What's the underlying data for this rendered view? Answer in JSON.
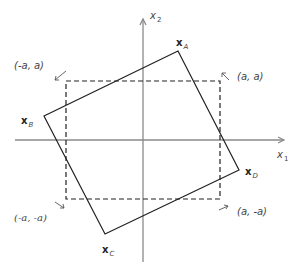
{
  "diagram": {
    "axes": {
      "x_label": "x",
      "x_sub": "1",
      "y_label": "x",
      "y_sub": "2",
      "origin": [
        143,
        140
      ],
      "color": "#8a8a8a"
    },
    "square": {
      "style": "dashed",
      "color": "#222222",
      "corners": {
        "top_left": "(-a, a)",
        "top_right": "(a, a)",
        "bottom_left": "(-a, -a)",
        "bottom_right": "(a, -a)"
      }
    },
    "rotated_square": {
      "color": "#222222",
      "vertices": [
        {
          "name": "A",
          "label": "x",
          "sub": "A"
        },
        {
          "name": "B",
          "label": "x",
          "sub": "B"
        },
        {
          "name": "C",
          "label": "x",
          "sub": "C"
        },
        {
          "name": "D",
          "label": "x",
          "sub": "D"
        }
      ]
    }
  }
}
